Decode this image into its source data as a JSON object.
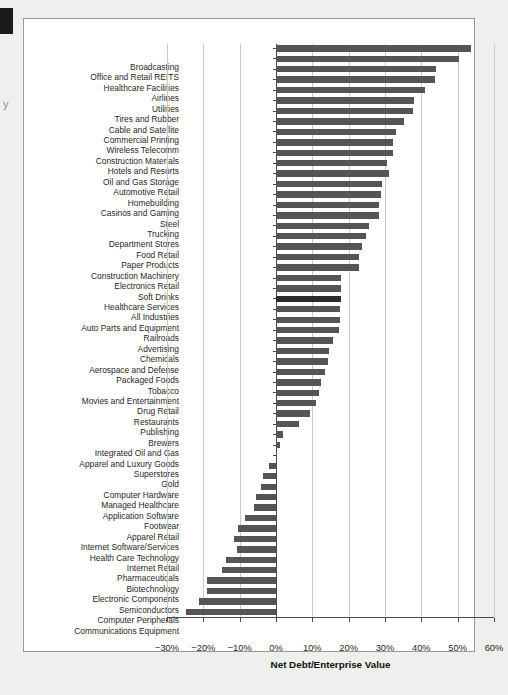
{
  "page": {
    "margin_caption": "y",
    "background": "#efefed",
    "frame_color": "#9a9a98"
  },
  "chart_data": {
    "type": "bar",
    "orientation": "horizontal",
    "title": "",
    "xlabel": "Net Debt/Enterprise Value",
    "ylabel": "",
    "xlim": [
      -30,
      60
    ],
    "xticks": [
      -30,
      -20,
      -10,
      0,
      10,
      20,
      30,
      40,
      50,
      60
    ],
    "xtick_labels": [
      "−30%",
      "−20%",
      "−10%",
      "0%",
      "10%",
      "20%",
      "30%",
      "40%",
      "50%",
      "60%"
    ],
    "grid": true,
    "grid_axis": "x",
    "legend": false,
    "bar_color": "#555553",
    "highlight_color": "#2b2b29",
    "highlight_category": "All Industries",
    "units": "percent",
    "categories": [
      "Broadcasting",
      "Office and Retail REITS",
      "Healthcare Facilities",
      "Airlines",
      "Utilities",
      "Tires and Rubber",
      "Cable and Satellite",
      "Commercial Printing",
      "Wireless Telecomm",
      "Construction Materials",
      "Hotels and Resorts",
      "Oil and Gas Storage",
      "Automotive Retail",
      "Homebuilding",
      "Casinos and Gaming",
      "Steel",
      "Trucking",
      "Department Stores",
      "Food Retail",
      "Paper Products",
      "Construction Machinery",
      "Electronics Retail",
      "Soft Drinks",
      "Healthcare Services",
      "All Industries",
      "Auto Parts and Equipment",
      "Railroads",
      "Advertising",
      "Chemicals",
      "Aerospace and Defense",
      "Packaged Foods",
      "Tobacco",
      "Movies and Entertainment",
      "Drug Retail",
      "Restaurants",
      "Publishing",
      "Brewers",
      "Integrated Oil and Gas",
      "Apparel and Luxury Goods",
      "Superstores",
      "Gold",
      "Computer Hardware",
      "Managed Healthcare",
      "Application Software",
      "Footwear",
      "Apparel Retail",
      "Internet Software/Services",
      "Health Care Technology",
      "Internet Retail",
      "Pharmaceuticals",
      "Biotechnology",
      "Electronic Components",
      "Semiconductors",
      "Computer Peripherals",
      "Communications Equipment"
    ],
    "values": [
      53.7,
      50.3,
      44.0,
      43.7,
      40.9,
      38.0,
      37.7,
      35.1,
      33.0,
      32.3,
      32.3,
      30.6,
      31.1,
      29.2,
      29.0,
      28.3,
      28.3,
      25.6,
      24.8,
      23.6,
      22.9,
      22.9,
      18.0,
      18.0,
      17.9,
      17.7,
      17.5,
      17.4,
      15.6,
      14.7,
      14.3,
      13.4,
      12.5,
      11.8,
      11.0,
      9.3,
      6.3,
      1.9,
      1.0,
      0.0,
      -1.8,
      -3.6,
      -4.0,
      -5.5,
      -6.0,
      -8.6,
      -10.4,
      -11.6,
      -10.7,
      -13.7,
      -14.9,
      -19.0,
      -19.0,
      -21.3,
      -24.7
    ]
  }
}
